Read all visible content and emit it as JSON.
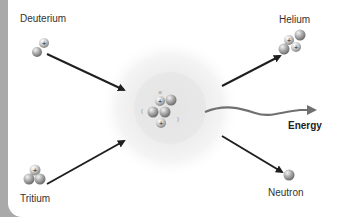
{
  "labels": {
    "deuterium": "Deuterium",
    "tritium": "Tritium",
    "helium": "Helium",
    "neutron": "Neutron",
    "energy": "Energy"
  },
  "symbols": {
    "proton": "+"
  },
  "colors": {
    "background": "#ffffff",
    "frame": "#a9a9a9",
    "arrow": "#1f1f1f",
    "energy_wave": "#707070",
    "glow_outer": "#f1f1f1",
    "glow_inner": "#e4e4e4",
    "particle": "#9a9a9a"
  }
}
